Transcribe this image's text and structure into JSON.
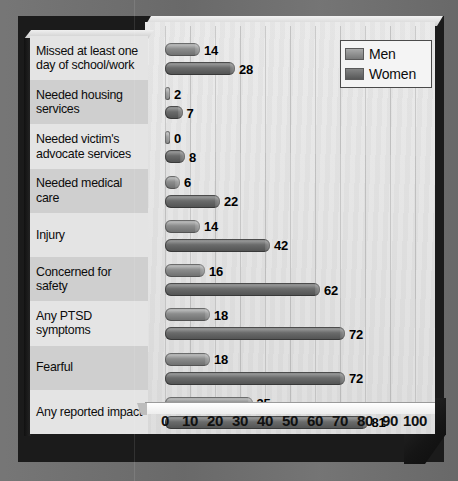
{
  "chart_data": {
    "type": "bar",
    "orientation": "horizontal",
    "title": "",
    "xlabel": "",
    "ylabel": "",
    "xlim": [
      0,
      100
    ],
    "xticks": [
      0,
      10,
      20,
      30,
      40,
      50,
      60,
      70,
      80,
      90,
      100
    ],
    "grid": true,
    "legend_position": "top-right",
    "categories": [
      "Missed at least one day of school/work",
      "Needed housing services",
      "Needed victim's advocate services",
      "Needed medical care",
      "Injury",
      "Concerned for safety",
      "Any PTSD symptoms",
      "Fearful",
      "Any reported impact"
    ],
    "series": [
      {
        "name": "Men",
        "color": "#8b8c8c",
        "values": [
          14,
          2,
          0,
          6,
          14,
          16,
          18,
          18,
          35
        ]
      },
      {
        "name": "Women",
        "color": "#5f6060",
        "values": [
          28,
          7,
          8,
          22,
          42,
          62,
          72,
          72,
          81
        ]
      }
    ]
  },
  "legend": {
    "items": [
      {
        "label": "Men",
        "swatch": "men-swatch"
      },
      {
        "label": "Women",
        "swatch": "women-swatch"
      }
    ]
  },
  "colors": {
    "backdrop": "#6f6f6f",
    "base_slab": "#1b1b1b",
    "plot_background": "#e4e4e4",
    "label_band_light": "#e4e4e4",
    "label_band_dark": "#cfcfcf",
    "men_bar": "#8b8c8c",
    "women_bar": "#5f6060",
    "value_text": "#000000"
  }
}
